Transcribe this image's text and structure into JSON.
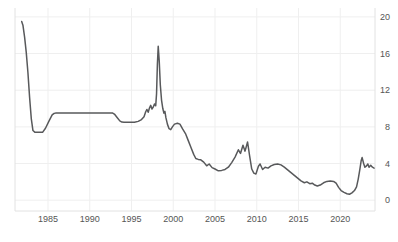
{
  "chart_data": {
    "type": "line",
    "title": "",
    "xlabel": "",
    "ylabel": "",
    "legend": "none",
    "grid": true,
    "y_axis_side": "right",
    "xlim": [
      1981.05,
      2024.16
    ],
    "ylim": [
      -1.18,
      20.97
    ],
    "x_ticks": [
      1985,
      1990,
      1995,
      2000,
      2005,
      2010,
      2015,
      2020
    ],
    "x_tick_labels": [
      "1985",
      "1990",
      "1995",
      "2000",
      "2005",
      "2010",
      "2015",
      "2020"
    ],
    "y_ticks": [
      0,
      4,
      8,
      12,
      16,
      20
    ],
    "y_tick_labels": [
      "0",
      "4",
      "8",
      "12",
      "16",
      "20"
    ],
    "colors": {
      "line": "#58595b",
      "grid": "#efefef",
      "border": "#e2e2e2",
      "label": "#555555",
      "background": "#ffffff"
    },
    "series": [
      {
        "name": "rate",
        "points": [
          [
            1981.85,
            19.5
          ],
          [
            1982.0,
            19.1
          ],
          [
            1982.2,
            17.8
          ],
          [
            1982.4,
            16.1
          ],
          [
            1982.6,
            13.9
          ],
          [
            1982.8,
            11.2
          ],
          [
            1983.0,
            8.9
          ],
          [
            1983.2,
            7.6
          ],
          [
            1983.45,
            7.4
          ],
          [
            1984.35,
            7.4
          ],
          [
            1984.7,
            7.85
          ],
          [
            1985.1,
            8.6
          ],
          [
            1985.5,
            9.3
          ],
          [
            1985.7,
            9.45
          ],
          [
            1985.9,
            9.5
          ],
          [
            1992.75,
            9.5
          ],
          [
            1993.0,
            9.35
          ],
          [
            1993.3,
            9.0
          ],
          [
            1993.6,
            8.65
          ],
          [
            1993.85,
            8.52
          ],
          [
            1994.1,
            8.5
          ],
          [
            1995.35,
            8.5
          ],
          [
            1995.8,
            8.6
          ],
          [
            1996.2,
            8.8
          ],
          [
            1996.5,
            9.1
          ],
          [
            1996.7,
            9.65
          ],
          [
            1996.85,
            9.9
          ],
          [
            1997.0,
            9.6
          ],
          [
            1997.15,
            10.05
          ],
          [
            1997.3,
            10.35
          ],
          [
            1997.45,
            9.95
          ],
          [
            1997.6,
            10.15
          ],
          [
            1997.75,
            10.5
          ],
          [
            1997.9,
            10.3
          ],
          [
            1998.0,
            11.6
          ],
          [
            1998.1,
            14.8
          ],
          [
            1998.2,
            16.8
          ],
          [
            1998.32,
            15.2
          ],
          [
            1998.45,
            12.6
          ],
          [
            1998.6,
            10.9
          ],
          [
            1998.75,
            10.0
          ],
          [
            1998.88,
            9.5
          ],
          [
            1999.0,
            9.7
          ],
          [
            1999.12,
            9.0
          ],
          [
            1999.3,
            8.3
          ],
          [
            1999.5,
            7.8
          ],
          [
            1999.7,
            7.7
          ],
          [
            1999.9,
            8.0
          ],
          [
            2000.15,
            8.3
          ],
          [
            2000.5,
            8.4
          ],
          [
            2000.8,
            8.3
          ],
          [
            2001.1,
            7.8
          ],
          [
            2001.5,
            7.2
          ],
          [
            2001.8,
            6.5
          ],
          [
            2002.1,
            5.8
          ],
          [
            2002.45,
            5.0
          ],
          [
            2002.7,
            4.55
          ],
          [
            2003.0,
            4.45
          ],
          [
            2003.3,
            4.4
          ],
          [
            2003.65,
            4.15
          ],
          [
            2004.0,
            3.75
          ],
          [
            2004.3,
            3.95
          ],
          [
            2004.65,
            3.55
          ],
          [
            2005.0,
            3.4
          ],
          [
            2005.4,
            3.2
          ],
          [
            2005.8,
            3.25
          ],
          [
            2006.2,
            3.35
          ],
          [
            2006.6,
            3.6
          ],
          [
            2007.0,
            4.1
          ],
          [
            2007.4,
            4.7
          ],
          [
            2007.8,
            5.5
          ],
          [
            2008.05,
            5.1
          ],
          [
            2008.35,
            6.0
          ],
          [
            2008.6,
            5.35
          ],
          [
            2008.9,
            6.35
          ],
          [
            2009.15,
            4.8
          ],
          [
            2009.4,
            3.4
          ],
          [
            2009.65,
            2.95
          ],
          [
            2009.9,
            2.85
          ],
          [
            2010.2,
            3.7
          ],
          [
            2010.4,
            3.95
          ],
          [
            2010.7,
            3.35
          ],
          [
            2011.0,
            3.6
          ],
          [
            2011.35,
            3.5
          ],
          [
            2011.7,
            3.75
          ],
          [
            2012.1,
            3.9
          ],
          [
            2012.5,
            3.95
          ],
          [
            2012.9,
            3.85
          ],
          [
            2013.3,
            3.6
          ],
          [
            2013.7,
            3.3
          ],
          [
            2014.1,
            3.0
          ],
          [
            2014.5,
            2.7
          ],
          [
            2014.9,
            2.4
          ],
          [
            2015.3,
            2.1
          ],
          [
            2015.7,
            1.9
          ],
          [
            2016.0,
            2.0
          ],
          [
            2016.35,
            1.8
          ],
          [
            2016.65,
            1.85
          ],
          [
            2016.95,
            1.65
          ],
          [
            2017.25,
            1.55
          ],
          [
            2017.6,
            1.65
          ],
          [
            2018.0,
            1.9
          ],
          [
            2018.4,
            2.05
          ],
          [
            2018.8,
            2.1
          ],
          [
            2019.2,
            2.05
          ],
          [
            2019.5,
            1.85
          ],
          [
            2019.8,
            1.4
          ],
          [
            2020.1,
            1.05
          ],
          [
            2020.45,
            0.85
          ],
          [
            2020.8,
            0.7
          ],
          [
            2021.1,
            0.65
          ],
          [
            2021.4,
            0.8
          ],
          [
            2021.7,
            1.05
          ],
          [
            2021.95,
            1.45
          ],
          [
            2022.15,
            2.3
          ],
          [
            2022.35,
            3.4
          ],
          [
            2022.5,
            4.3
          ],
          [
            2022.62,
            4.65
          ],
          [
            2022.8,
            4.0
          ],
          [
            2022.95,
            3.6
          ],
          [
            2023.15,
            3.75
          ],
          [
            2023.3,
            3.95
          ],
          [
            2023.45,
            3.6
          ],
          [
            2023.65,
            3.8
          ],
          [
            2023.85,
            3.6
          ],
          [
            2024.05,
            3.5
          ]
        ]
      }
    ]
  }
}
